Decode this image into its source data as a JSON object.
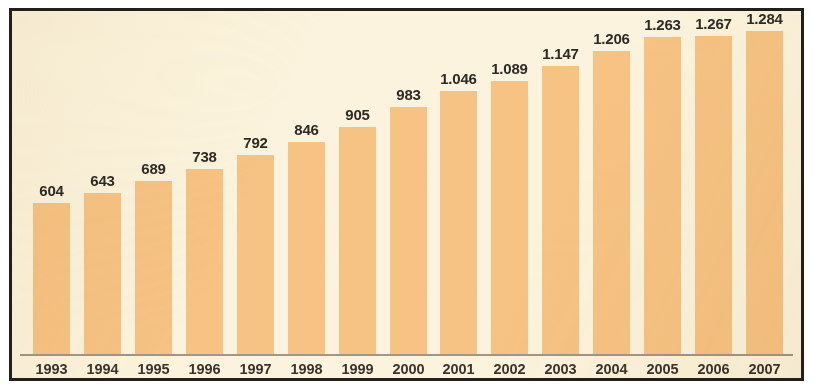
{
  "figure": {
    "background_color": "#ffffff",
    "plot_background_color": "#fbf3dd",
    "frame_color": "#221f1c",
    "baseline_color": "#a39685",
    "bar_color": "#f6c384",
    "label_color": "#2e2a26"
  },
  "chart_data": {
    "type": "bar",
    "title": "",
    "subtitle": "",
    "xlabel": "",
    "ylabel": "",
    "categories": [
      "1993",
      "1994",
      "1995",
      "1996",
      "1997",
      "1998",
      "1999",
      "2000",
      "2001",
      "2002",
      "2003",
      "2004",
      "2005",
      "2006",
      "2007"
    ],
    "values": [
      604,
      643,
      689,
      738,
      792,
      846,
      905,
      983,
      1046,
      1089,
      1147,
      1206,
      1263,
      1267,
      1284
    ],
    "value_labels": [
      "604",
      "643",
      "689",
      "738",
      "792",
      "846",
      "905",
      "983",
      "1.046",
      "1.089",
      "1.147",
      "1.206",
      "1.263",
      "1.267",
      "1.284"
    ],
    "tick_labels": [
      "1993",
      "1994",
      "1995",
      "1996",
      "1997",
      "1998",
      "1999",
      "2000",
      "2001",
      "2002",
      "2003",
      "2004",
      "2005",
      "2006",
      "2007"
    ],
    "ylim": [
      0,
      1365
    ],
    "grid": false,
    "legend": [],
    "legend_position": "none",
    "data_labels_shown": true,
    "thousands_separator": ".",
    "series": [
      {
        "name": "",
        "values": [
          604,
          643,
          689,
          738,
          792,
          846,
          905,
          983,
          1046,
          1089,
          1147,
          1206,
          1263,
          1267,
          1284
        ]
      }
    ]
  }
}
